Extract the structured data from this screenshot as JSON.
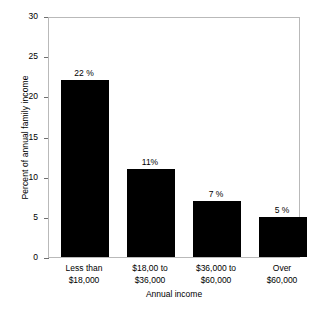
{
  "chart_data": {
    "type": "bar",
    "title": "",
    "xlabel": "Annual income",
    "ylabel": "Percent of annual family income",
    "categories": [
      "Less than $18,000",
      "$18,00 to $36,000",
      "$36,000 to $60,000",
      "Over $60,000"
    ],
    "category_lines": [
      [
        "Less than",
        "$18,000"
      ],
      [
        "$18,00 to",
        "$36,000"
      ],
      [
        "$36,000 to",
        "$60,000"
      ],
      [
        "Over",
        "$60,000"
      ]
    ],
    "values": [
      22,
      11,
      7,
      5
    ],
    "value_labels": [
      "22 %",
      "11%",
      "7 %",
      "5 %"
    ],
    "ylim": [
      0,
      30
    ],
    "yticks": [
      0,
      5,
      10,
      15,
      20,
      25,
      30
    ],
    "ytick_labels": [
      "0",
      "5",
      "10",
      "15",
      "20",
      "25",
      "30"
    ],
    "grid": false,
    "legend": "none",
    "bar_color": "#000000",
    "frame_color": "#b9b9b9",
    "background": "#ffffff"
  },
  "axis": {
    "y_title": "Percent of annual family income",
    "x_title": "Annual income"
  },
  "ticks": {
    "y": [
      {
        "label": "30",
        "value": 30
      },
      {
        "label": "25",
        "value": 25
      },
      {
        "label": "20",
        "value": 20
      },
      {
        "label": "15",
        "value": 15
      },
      {
        "label": "10",
        "value": 10
      },
      {
        "label": "5",
        "value": 5
      },
      {
        "label": "0",
        "value": 0
      }
    ]
  },
  "bars": [
    {
      "label": "22 %",
      "line1": "Less than",
      "line2": "$18,000"
    },
    {
      "label": "11%",
      "line1": "$18,00 to",
      "line2": "$36,000"
    },
    {
      "label": "7 %",
      "line1": "$36,000 to",
      "line2": "$60,000"
    },
    {
      "label": "5 %",
      "line1": "Over",
      "line2": "$60,000"
    }
  ]
}
